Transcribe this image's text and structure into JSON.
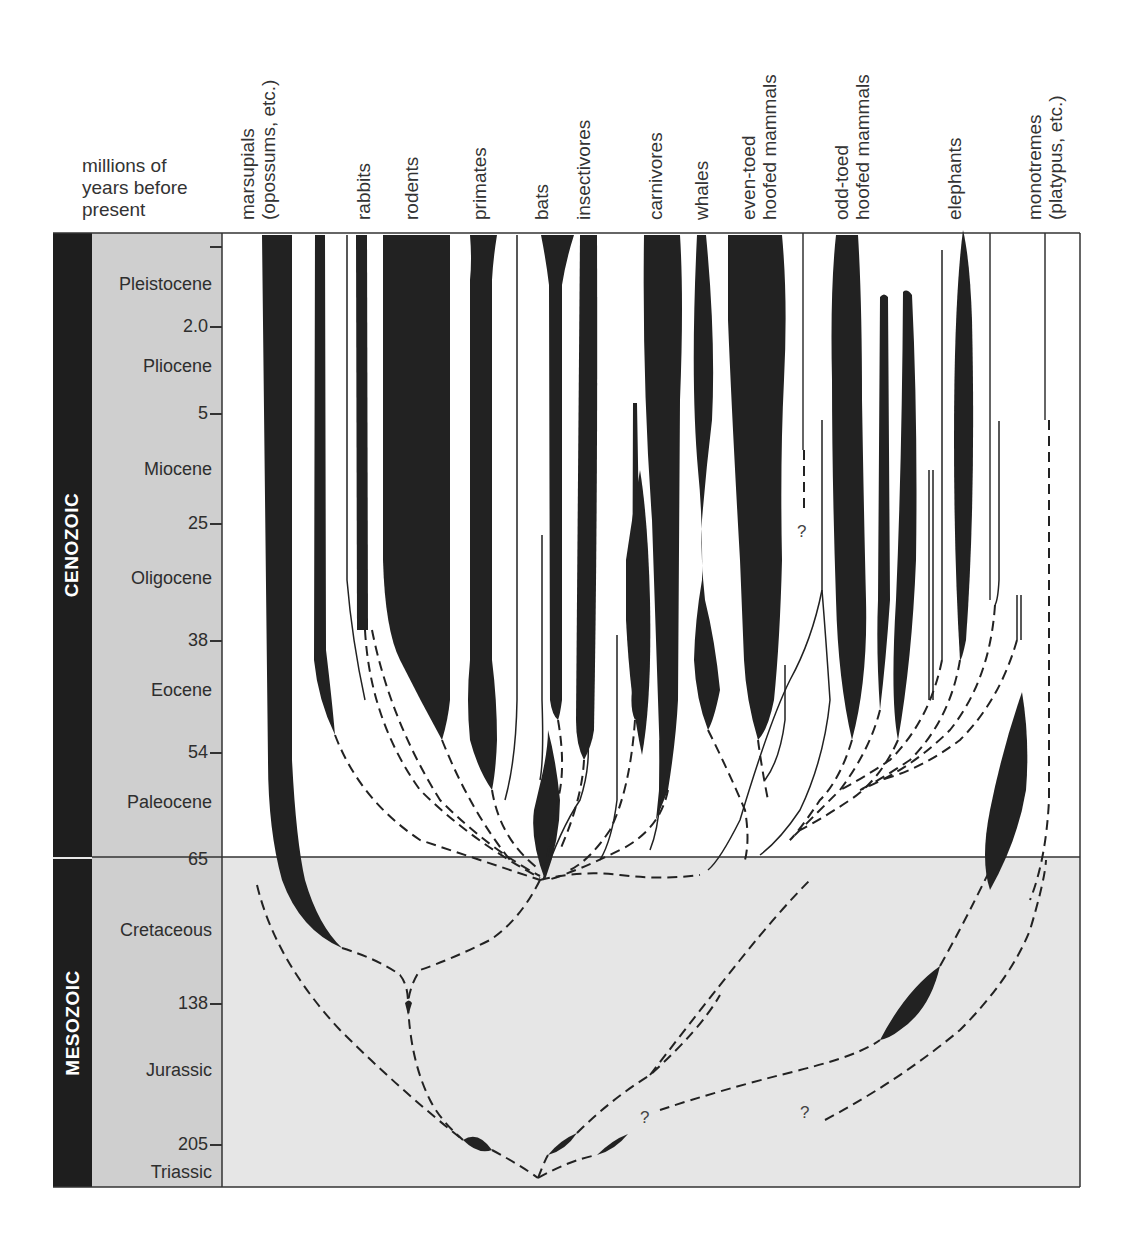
{
  "axis": {
    "title_lines": [
      "millions of",
      "years before",
      "present"
    ]
  },
  "eras": [
    {
      "name": "CENOZOIC",
      "top": 233,
      "bottom": 857
    },
    {
      "name": "MESOZOIC",
      "top": 859,
      "bottom": 1187
    }
  ],
  "epochs": [
    {
      "name": "Pleistocene",
      "y": 284
    },
    {
      "name": "Pliocene",
      "y": 366
    },
    {
      "name": "Miocene",
      "y": 469
    },
    {
      "name": "Oligocene",
      "y": 578
    },
    {
      "name": "Eocene",
      "y": 690
    },
    {
      "name": "Paleocene",
      "y": 802
    },
    {
      "name": "Cretaceous",
      "y": 930
    },
    {
      "name": "Jurassic",
      "y": 1070
    },
    {
      "name": "Triassic",
      "y": 1172
    }
  ],
  "ticks": [
    {
      "label": "",
      "y": 246
    },
    {
      "label": "2.0",
      "y": 326
    },
    {
      "label": "5",
      "y": 413
    },
    {
      "label": "25",
      "y": 523
    },
    {
      "label": "38",
      "y": 640
    },
    {
      "label": "54",
      "y": 752
    },
    {
      "label": "65",
      "y": 859
    },
    {
      "label": "138",
      "y": 1003
    },
    {
      "label": "205",
      "y": 1144
    }
  ],
  "groups": [
    {
      "label_lines": [
        "marsupials",
        "(opossums, etc.)"
      ],
      "x": 257
    },
    {
      "label_lines": [
        "rabbits"
      ],
      "x": 352
    },
    {
      "label_lines": [
        "rodents"
      ],
      "x": 400
    },
    {
      "label_lines": [
        "primates"
      ],
      "x": 468
    },
    {
      "label_lines": [
        "bats"
      ],
      "x": 530
    },
    {
      "label_lines": [
        "insectivores"
      ],
      "x": 570
    },
    {
      "label_lines": [
        "carnivores"
      ],
      "x": 645
    },
    {
      "label_lines": [
        "whales"
      ],
      "x": 690
    },
    {
      "label_lines": [
        "even-toed",
        "hoofed mammals"
      ],
      "x": 738
    },
    {
      "label_lines": [
        "odd-toed",
        "hoofed mammals"
      ],
      "x": 830
    },
    {
      "label_lines": [
        "elephants"
      ],
      "x": 944
    },
    {
      "label_lines": [
        "monotremes",
        "(platypus, etc.)"
      ],
      "x": 1025
    }
  ],
  "question_marks": [
    {
      "text": "?",
      "x": 797,
      "y": 533
    },
    {
      "text": "?",
      "x": 640,
      "y": 1120
    },
    {
      "text": "?",
      "x": 800,
      "y": 1115
    }
  ],
  "colors": {
    "lineage_fill": "#222222",
    "mesozoic_bg": "#e6e6e6",
    "epoch_band": "#cfcfcf",
    "era_band": "#1e1e1e"
  }
}
